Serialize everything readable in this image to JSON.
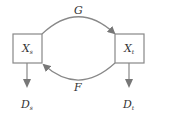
{
  "diagram": {
    "nodes": [
      {
        "id": "xs",
        "label": "X",
        "sub": "s"
      },
      {
        "id": "xt",
        "label": "X",
        "sub": "t"
      }
    ],
    "outputs": [
      {
        "id": "ds",
        "label": "D",
        "sub": "s"
      },
      {
        "id": "dt",
        "label": "D",
        "sub": "t"
      }
    ],
    "edges": [
      {
        "id": "g",
        "label": "G",
        "from": "xs",
        "to": "xt"
      },
      {
        "id": "f",
        "label": "F",
        "from": "xt",
        "to": "xs"
      }
    ],
    "colors": {
      "stroke": "#888888",
      "text": "#333333"
    }
  }
}
